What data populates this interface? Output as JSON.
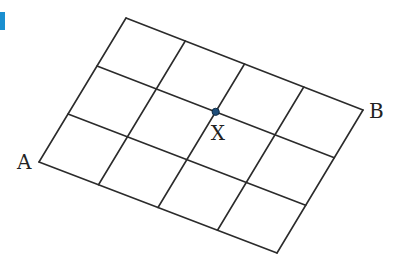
{
  "diagram": {
    "type": "parallelogram-grid",
    "columns": 4,
    "rows": 3,
    "corners": {
      "A": [
        39,
        162
      ],
      "top_left": [
        126,
        18
      ],
      "B": [
        363,
        110
      ],
      "bottom_right": [
        277,
        253
      ]
    },
    "point": {
      "label": "X",
      "grid_col": 2,
      "grid_row": 2,
      "color": "#1f4e79"
    },
    "labels": {
      "A": "A",
      "B": "B",
      "X": "X"
    },
    "line_color": "#2b2b2b",
    "accent_color": "#1a8fd0"
  }
}
